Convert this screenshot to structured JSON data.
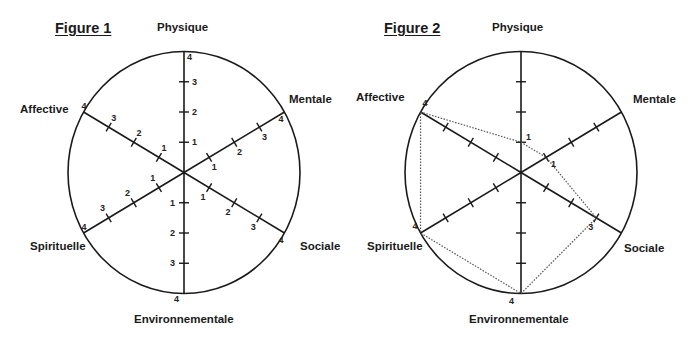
{
  "chart_data": [
    {
      "type": "radar",
      "title": "Figure 1",
      "axes": [
        "Physique",
        "Mentale",
        "Sociale",
        "Environnementale",
        "Spirituelle",
        "Affective"
      ],
      "scale": [
        0,
        4
      ],
      "tick_labels": [
        "1",
        "2",
        "3",
        "4"
      ],
      "tick_labels_shown": true,
      "series": []
    },
    {
      "type": "radar",
      "title": "Figure 2",
      "axes": [
        "Physique",
        "Mentale",
        "Sociale",
        "Environnementale",
        "Spirituelle",
        "Affective"
      ],
      "scale": [
        0,
        4
      ],
      "tick_labels_shown": false,
      "series": [
        {
          "name": "profil",
          "style": "dotted",
          "values": {
            "Physique": 1,
            "Mentale": 1,
            "Sociale": 3,
            "Environnementale": 4,
            "Spirituelle": 4,
            "Affective": 4
          },
          "value_labels": {
            "Physique": "1",
            "Mentale": "1",
            "Sociale": "3",
            "Environnementale": "4",
            "Spirituelle": "4",
            "Affective": "4"
          }
        }
      ]
    }
  ],
  "figures": [
    {
      "title": "Figure 1",
      "labels": {
        "physique": "Physique",
        "mentale": "Mentale",
        "sociale": "Sociale",
        "environnementale": "Environnementale",
        "spirituelle": "Spirituelle",
        "affective": "Affective"
      }
    },
    {
      "title": "Figure 2",
      "labels": {
        "physique": "Physique",
        "mentale": "Mentale",
        "sociale": "Sociale",
        "environnementale": "Environnementale",
        "spirituelle": "Spirituelle",
        "affective": "Affective"
      }
    }
  ],
  "colors": {
    "line": "#1a1a1a",
    "dotted": "#555555",
    "background": "#ffffff"
  }
}
